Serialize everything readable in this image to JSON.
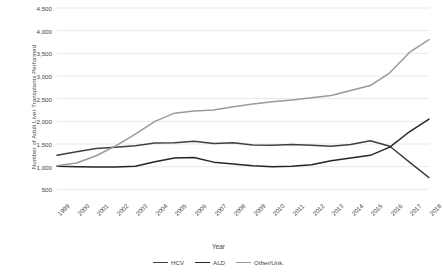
{
  "chart_data": {
    "type": "line",
    "title": "",
    "xlabel": "Year",
    "ylabel": "Number of Adult Liver Transplants Performed",
    "x": [
      1999,
      2000,
      2001,
      2002,
      2003,
      2004,
      2005,
      2006,
      2007,
      2008,
      2009,
      2010,
      2011,
      2012,
      2013,
      2014,
      2015,
      2016,
      2017,
      2018
    ],
    "categories": [
      "1999",
      "2000",
      "2001",
      "2002",
      "2003",
      "2004",
      "2005",
      "2006",
      "2007",
      "2008",
      "2009",
      "2010",
      "2011",
      "2012",
      "2013",
      "2014",
      "2015",
      "2016",
      "2017",
      "2018"
    ],
    "ylim": [
      0,
      4500
    ],
    "yticks": [
      500,
      1000,
      1500,
      2000,
      2500,
      3000,
      3500,
      4000,
      4500
    ],
    "ytick_labels": [
      "500",
      "1,000",
      "1,500",
      "2,000",
      "2,500",
      "3,000",
      "3,500",
      "4,000",
      "4,500"
    ],
    "grid": true,
    "legend_position": "bottom",
    "series": [
      {
        "name": "HCV",
        "color": "#404040",
        "values": [
          1250,
          1330,
          1400,
          1430,
          1460,
          1520,
          1530,
          1560,
          1510,
          1530,
          1480,
          1470,
          1490,
          1470,
          1450,
          1490,
          1570,
          1450,
          1100,
          760
        ]
      },
      {
        "name": "ALD",
        "color": "#262626",
        "values": [
          1010,
          1000,
          990,
          990,
          1010,
          1110,
          1190,
          1200,
          1100,
          1060,
          1020,
          1000,
          1010,
          1040,
          1130,
          1190,
          1250,
          1430,
          1770,
          2050
        ]
      },
      {
        "name": "Other/Unk.",
        "color": "#9a9a9a",
        "values": [
          1020,
          1080,
          1240,
          1460,
          1720,
          2000,
          2180,
          2230,
          2250,
          2320,
          2380,
          2430,
          2470,
          2520,
          2570,
          2680,
          2790,
          3070,
          3520,
          3800
        ]
      }
    ]
  },
  "legend": {
    "items": [
      {
        "label": "HCV"
      },
      {
        "label": "ALD"
      },
      {
        "label": "Other/Unk."
      }
    ]
  }
}
